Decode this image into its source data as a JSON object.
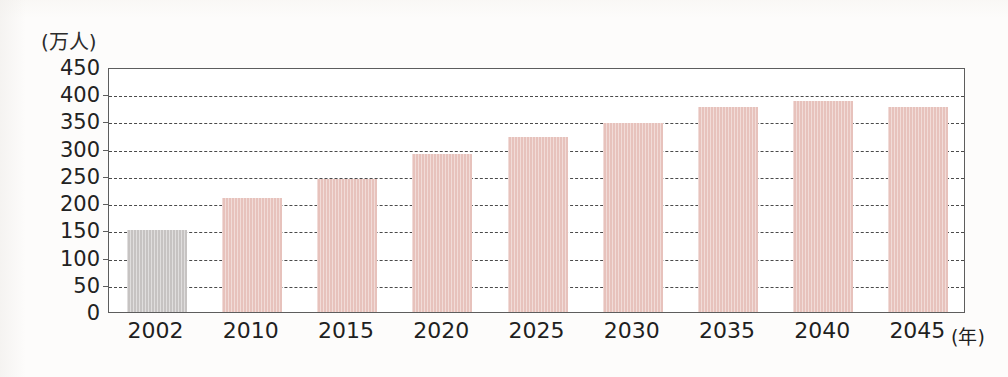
{
  "chart_data": {
    "type": "bar",
    "title": "",
    "subtitle": "",
    "xlabel": "(年)",
    "ylabel": "(万人)",
    "categories": [
      "2002",
      "2010",
      "2015",
      "2020",
      "2025",
      "2030",
      "2035",
      "2040",
      "2045"
    ],
    "values": [
      150,
      210,
      245,
      290,
      322,
      348,
      376,
      388,
      377
    ],
    "ylim": [
      0,
      450
    ],
    "yticks": [
      0,
      50,
      100,
      150,
      200,
      250,
      300,
      350,
      400,
      450
    ],
    "ytick_labels": [
      "0",
      "50",
      "100",
      "150",
      "200",
      "250",
      "300",
      "350",
      "400",
      "450"
    ],
    "grid": true,
    "grid_style": "dashed-horizontal",
    "legend": false,
    "legend_position": "none",
    "bar_colors": [
      "#c6c3c2",
      "#e7c2bc",
      "#e7c2bc",
      "#e7c2bc",
      "#e7c2bc",
      "#e7c2bc",
      "#e7c2bc",
      "#e7c2bc",
      "#e7c2bc"
    ],
    "accent_color": "#e7c2bc",
    "highlight_color": "#c6c3c2",
    "axis_color": "#5d5d5d"
  },
  "axes": {
    "y_unit_label": "(万人)",
    "x_unit_label": "(年)"
  }
}
